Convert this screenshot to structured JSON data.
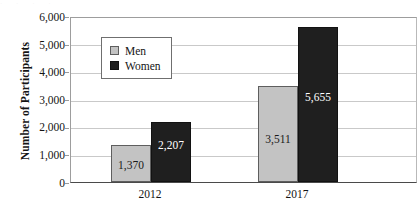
{
  "chart_data": {
    "type": "bar",
    "title": "",
    "xlabel": "",
    "ylabel": "Number of Participants",
    "categories": [
      "2012",
      "2017"
    ],
    "series": [
      {
        "name": "Men",
        "color": "#c3c3c3",
        "values": [
          1370,
          3511
        ],
        "labels": [
          "1,370",
          "3,511"
        ]
      },
      {
        "name": "Women",
        "color": "#1f1f1f",
        "values": [
          2207,
          5655
        ],
        "labels": [
          "2,207",
          "5,655"
        ]
      }
    ],
    "ylim": [
      0,
      6000
    ],
    "ytick_labels": [
      "6,000",
      "5,000",
      "4,000",
      "3,000",
      "2,000",
      "1,000",
      "0"
    ],
    "ytick_values": [
      6000,
      5000,
      4000,
      3000,
      2000,
      1000,
      0
    ],
    "grid": true,
    "legend_position": "upper-left-inside"
  },
  "axis": {
    "y_title": "Number of Participants",
    "y_labels": {
      "t6000": "6,000",
      "t5000": "5,000",
      "t4000": "4,000",
      "t3000": "3,000",
      "t2000": "2,000",
      "t1000": "1,000",
      "t0": "0"
    },
    "x_labels": {
      "c0": "2012",
      "c1": "2017"
    }
  },
  "legend": {
    "men_label": "Men",
    "women_label": "Women"
  },
  "bars": {
    "men_2012": "1,370",
    "women_2012": "2,207",
    "men_2017": "3,511",
    "women_2017": "5,655"
  },
  "artifact": {
    "top_text": "· · · ·"
  }
}
